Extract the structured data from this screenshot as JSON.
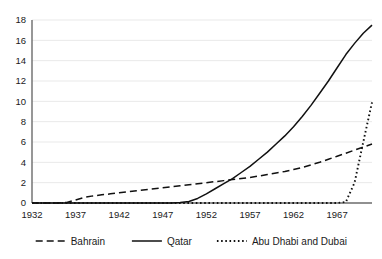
{
  "chart_data": {
    "type": "line",
    "title": "",
    "subtitle": "",
    "xlabel": "",
    "ylabel": "",
    "xlim": [
      1932,
      1971
    ],
    "ylim": [
      0,
      18
    ],
    "grid": true,
    "legend_position": "bottom",
    "x_ticks": [
      "1932",
      "1937",
      "1942",
      "1947",
      "1952",
      "1957",
      "1962",
      "1967"
    ],
    "x_tick_values": [
      1932,
      1937,
      1942,
      1947,
      1952,
      1957,
      1962,
      1967
    ],
    "y_ticks": [
      "0",
      "2",
      "4",
      "6",
      "8",
      "10",
      "12",
      "14",
      "16",
      "18"
    ],
    "y_tick_values": [
      0,
      2,
      4,
      6,
      8,
      10,
      12,
      14,
      16,
      18
    ],
    "x": [
      1932,
      1933,
      1934,
      1935,
      1936,
      1937,
      1938,
      1939,
      1940,
      1941,
      1942,
      1943,
      1944,
      1945,
      1946,
      1947,
      1948,
      1949,
      1950,
      1951,
      1952,
      1953,
      1954,
      1955,
      1956,
      1957,
      1958,
      1959,
      1960,
      1961,
      1962,
      1963,
      1964,
      1965,
      1966,
      1967,
      1968,
      1969,
      1970,
      1971
    ],
    "series": [
      {
        "name": "Bahrain",
        "style": "dashed",
        "color": "#111111",
        "values": [
          0,
          0,
          0,
          0,
          0.05,
          0.3,
          0.55,
          0.7,
          0.8,
          0.9,
          1.0,
          1.1,
          1.2,
          1.3,
          1.4,
          1.5,
          1.6,
          1.7,
          1.8,
          1.9,
          2.0,
          2.1,
          2.2,
          2.3,
          2.4,
          2.5,
          2.65,
          2.8,
          2.95,
          3.1,
          3.3,
          3.5,
          3.75,
          4.0,
          4.3,
          4.6,
          4.9,
          5.2,
          5.5,
          5.8
        ]
      },
      {
        "name": "Qatar",
        "style": "solid",
        "color": "#111111",
        "values": [
          0,
          0,
          0,
          0,
          0,
          0,
          0,
          0,
          0,
          0,
          0,
          0,
          0,
          0,
          0,
          0,
          0,
          0.05,
          0.15,
          0.45,
          0.9,
          1.4,
          1.9,
          2.4,
          3.0,
          3.6,
          4.3,
          5.0,
          5.8,
          6.6,
          7.5,
          8.5,
          9.6,
          10.8,
          12.0,
          13.3,
          14.6,
          15.7,
          16.7,
          17.5
        ]
      },
      {
        "name": "Abu Dhabi and Dubai",
        "style": "dotted",
        "color": "#111111",
        "values": [
          0,
          0,
          0,
          0,
          0,
          0,
          0,
          0,
          0,
          0,
          0,
          0,
          0,
          0,
          0,
          0,
          0,
          0,
          0,
          0,
          0,
          0,
          0,
          0,
          0,
          0,
          0,
          0,
          0,
          0,
          0,
          0,
          0,
          0,
          0,
          0,
          0.1,
          2.0,
          6.0,
          9.9
        ]
      }
    ]
  },
  "legend": {
    "items": [
      {
        "label": "Bahrain",
        "style": "dashed"
      },
      {
        "label": "Qatar",
        "style": "solid"
      },
      {
        "label": "Abu Dhabi and Dubai",
        "style": "dotted"
      }
    ]
  }
}
